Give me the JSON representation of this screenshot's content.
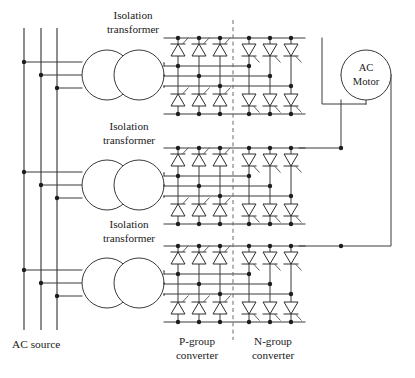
{
  "figure": {
    "type": "circuit-schematic",
    "width": 415,
    "height": 378
  },
  "labels": {
    "transformer_line1": "Isolation",
    "transformer_line2": "transformer",
    "motor_line1": "AC",
    "motor_line2": "Motor",
    "ac_source": "AC source",
    "p_group_line1": "P-group",
    "p_group_line2": "converter",
    "n_group_line1": "N-group",
    "n_group_line2": "converter"
  },
  "colors": {
    "wire": "#3a3a3a",
    "node": "#1d1d1d",
    "divider": "#6a6a6a",
    "text": "#1a1a1a",
    "background": "#ffffff"
  },
  "transformers": [
    {
      "name": "isolation-transformer-1",
      "cx_primary": 107,
      "cx_secondary": 139,
      "cy": 75,
      "r": 25,
      "label_x": 133,
      "label_y1": 19,
      "label_y2": 33
    },
    {
      "name": "isolation-transformer-2",
      "cx_primary": 107,
      "cx_secondary": 139,
      "cy": 185,
      "r": 25,
      "label_x": 129,
      "label_y1": 130,
      "label_y2": 144
    },
    {
      "name": "isolation-transformer-3",
      "cx_primary": 107,
      "cx_secondary": 139,
      "cy": 283,
      "r": 25,
      "label_x": 129,
      "label_y1": 228,
      "label_y2": 242
    }
  ],
  "source_bus": {
    "name": "three-phase-ac-source-bus",
    "x_positions": [
      24,
      41,
      57
    ],
    "y_top": 28,
    "y_bottom": 330,
    "tap_groups": [
      [
        62,
        75,
        88
      ],
      [
        172,
        185,
        198
      ],
      [
        270,
        283,
        296
      ]
    ],
    "label_x": 12,
    "label_y": 348
  },
  "converters": {
    "p_group": {
      "name": "p-group-converter",
      "column_x": [
        178,
        199,
        220
      ],
      "label_x": 197,
      "label_y1": 345,
      "label_y2": 359,
      "orientation": "upward"
    },
    "n_group": {
      "name": "n-group-converter",
      "column_x": [
        249,
        270,
        291
      ],
      "label_x": 273,
      "label_y1": 345,
      "label_y2": 359,
      "orientation": "downward"
    },
    "divider": {
      "name": "converter-divider",
      "x": 233,
      "y_top": 20,
      "y_bottom": 340
    },
    "banks": [
      {
        "name": "converter-bank-phase-a",
        "top_rail_y": 38,
        "bot_rail_y": 114,
        "thy_top_y": 50,
        "thy_bot_y": 100
      },
      {
        "name": "converter-bank-phase-b",
        "top_rail_y": 148,
        "bot_rail_y": 224,
        "thy_top_y": 160,
        "thy_bot_y": 210
      },
      {
        "name": "converter-bank-phase-c",
        "top_rail_y": 246,
        "bot_rail_y": 322,
        "thy_top_y": 258,
        "thy_bot_y": 308
      }
    ]
  },
  "motor": {
    "name": "ac-motor",
    "cx": 366,
    "cy": 75,
    "r": 25,
    "text_y1": 71,
    "text_y2": 85
  },
  "motor_leads": [
    {
      "name": "motor-lead-1",
      "path": "M 322,38 L 322,104 L 366,104"
    },
    {
      "name": "motor-lead-2",
      "path": "M 341,100 L 341,148 L 299,148"
    },
    {
      "name": "motor-lead-3",
      "path": "M 391,75 L 391,246 L 299,246"
    }
  ]
}
